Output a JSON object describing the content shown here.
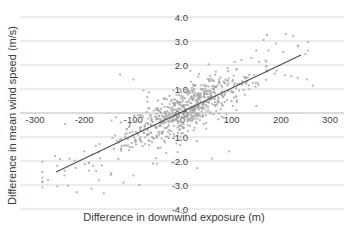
{
  "figure": {
    "background": "#ffffff"
  },
  "chart_data": {
    "type": "scatter",
    "xlabel": "Difference in downwind exposure (m)",
    "ylabel": "Difference in mean wind speed (m/s)",
    "xlim": [
      -300,
      300
    ],
    "ylim": [
      -4.0,
      4.0
    ],
    "x_ticks": [
      "-300",
      "-200",
      "-100",
      "0",
      "100",
      "200",
      "300"
    ],
    "y_ticks": [
      "4.0",
      "3.0",
      "2.0",
      "1.0",
      "0.0",
      "-1.0",
      "-2.0",
      "-3.0",
      "-4.0"
    ],
    "grid": "horizontal-only",
    "legend": "none",
    "axes_cross_at_zero": true,
    "colors": {
      "gridline": "#d9d9d9",
      "axis_line": "#b8b8b8",
      "point": "#a6a6a6",
      "trend_line": "#4d4d4d",
      "text": "#3f3f3f"
    },
    "trend_line": {
      "x1": -257,
      "y1": -2.46,
      "x2": 241,
      "y2": 2.42
    },
    "cloud_model": {
      "description": "approx. 750 gray square markers, dense ellipse centred near (0, 0.1), positive correlation ~0.01 (m/s)/m",
      "n": 720,
      "seed": 20,
      "x_components": [
        {
          "w": 0.8,
          "mean": 8,
          "sd": 55
        },
        {
          "w": 0.2,
          "mean": -25,
          "sd": 135
        }
      ],
      "x_range": [
        -285,
        255
      ],
      "slope": 0.0098,
      "intercept": 0.07,
      "noise": [
        {
          "w": 0.85,
          "sd": 0.42
        },
        {
          "w": 0.15,
          "sd": 0.8
        }
      ],
      "y_range": [
        -3.4,
        3.4
      ]
    },
    "extra_points": [
      [
        150,
        2.6
      ],
      [
        165,
        3.05
      ],
      [
        172,
        3.25
      ],
      [
        210,
        3.3
      ],
      [
        225,
        3.2
      ],
      [
        190,
        2.9
      ],
      [
        205,
        2.55
      ],
      [
        235,
        2.8
      ],
      [
        250,
        2.45
      ],
      [
        255,
        2.6
      ],
      [
        140,
        2.3
      ],
      [
        120,
        2.2
      ],
      [
        253,
        1.4
      ],
      [
        265,
        1.15
      ],
      [
        -215,
        -3.3
      ],
      [
        -185,
        -3.15
      ],
      [
        -160,
        -3.35
      ],
      [
        -240,
        -2.6
      ],
      [
        -255,
        -2.2
      ],
      [
        -230,
        -1.9
      ],
      [
        -190,
        -2.4
      ],
      [
        -170,
        -2.8
      ],
      [
        -145,
        -2.5
      ],
      [
        -120,
        -2.9
      ],
      [
        -100,
        -2.6
      ],
      [
        -88,
        -3.0
      ],
      [
        -127,
        1.6
      ],
      [
        -100,
        1.4
      ],
      [
        -60,
        -2.1
      ],
      [
        30,
        -2.3
      ],
      [
        60,
        -1.9
      ],
      [
        95,
        -1.6
      ]
    ]
  }
}
